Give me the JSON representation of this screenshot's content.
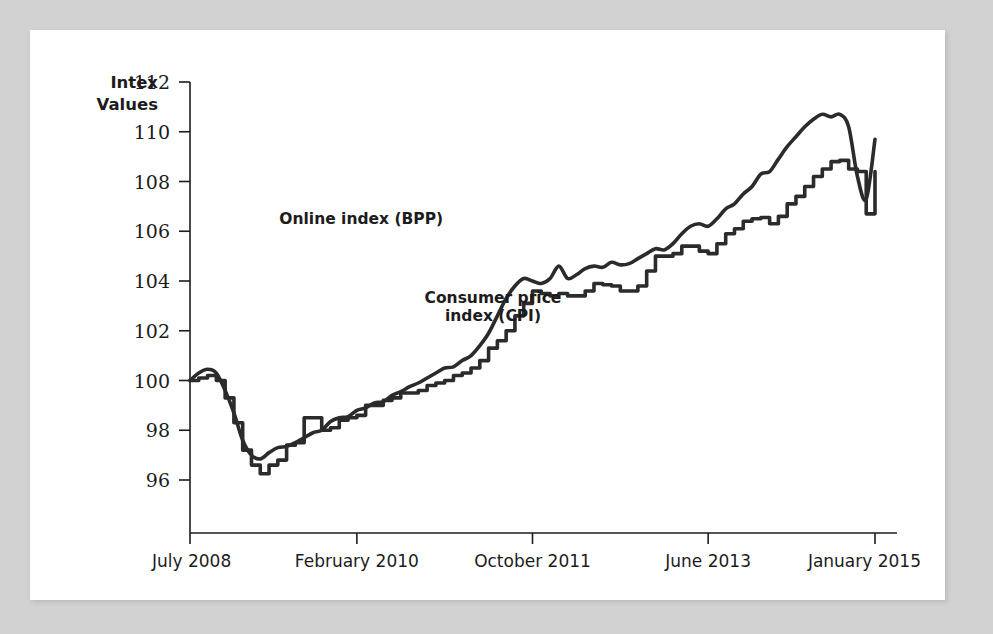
{
  "figure": {
    "background_color": "#d2d2d2",
    "card_color": "#ffffff",
    "line_color": "#2b2b2b"
  },
  "chart_data": {
    "type": "line",
    "title": "",
    "xlabel": "",
    "ylabel": "Intex\nValues",
    "ylabel_line1": "Intex",
    "ylabel_line2": "Values",
    "ylim": [
      95,
      112
    ],
    "ytick_values": [
      96,
      98,
      100,
      102,
      104,
      106,
      108,
      110,
      112
    ],
    "ytick_labels": [
      "96",
      "98",
      "100",
      "102",
      "104",
      "106",
      "108",
      "110",
      "112"
    ],
    "xlim": [
      0,
      78
    ],
    "xtick_positions": [
      0,
      19,
      39,
      59,
      78
    ],
    "xtick_labels": [
      "July 2008",
      "February 2010",
      "October 2011",
      "June 2013",
      "January 2015"
    ],
    "grid": false,
    "legend_position": "inline-annotation",
    "annotations": [
      {
        "text": "Online index (BPP)",
        "x": 19.5,
        "y": 106.3
      },
      {
        "text": "Consumer price",
        "x": 34.5,
        "y": 103.1
      },
      {
        "text": "index (CPI)",
        "x": 34.5,
        "y": 102.4
      }
    ],
    "series": [
      {
        "name": "Online index (BPP)",
        "style": "smooth",
        "x": [
          0,
          1,
          2,
          3,
          4,
          5,
          6,
          7,
          8,
          9,
          10,
          11,
          12,
          13,
          14,
          15,
          16,
          17,
          18,
          19,
          20,
          21,
          22,
          23,
          24,
          25,
          26,
          27,
          28,
          29,
          30,
          31,
          32,
          33,
          34,
          35,
          36,
          37,
          38,
          39,
          40,
          41,
          42,
          43,
          44,
          45,
          46,
          47,
          48,
          49,
          50,
          51,
          52,
          53,
          54,
          55,
          56,
          57,
          58,
          59,
          60,
          61,
          62,
          63,
          64,
          65,
          66,
          67,
          68,
          69,
          70,
          71,
          72,
          73,
          74,
          75,
          76,
          77,
          78
        ],
        "values": [
          100.0,
          100.3,
          100.45,
          100.3,
          99.6,
          98.7,
          97.6,
          97.0,
          96.85,
          97.1,
          97.3,
          97.35,
          97.5,
          97.7,
          97.9,
          98.0,
          98.35,
          98.5,
          98.55,
          98.8,
          98.9,
          99.1,
          99.15,
          99.4,
          99.55,
          99.75,
          99.9,
          100.1,
          100.3,
          100.5,
          100.55,
          100.8,
          101.0,
          101.4,
          101.9,
          102.6,
          103.3,
          103.8,
          104.1,
          104.0,
          103.9,
          104.1,
          104.6,
          104.1,
          104.25,
          104.5,
          104.6,
          104.55,
          104.75,
          104.65,
          104.7,
          104.9,
          105.1,
          105.3,
          105.25,
          105.5,
          105.9,
          106.2,
          106.3,
          106.2,
          106.5,
          106.9,
          107.1,
          107.5,
          107.8,
          108.3,
          108.4,
          108.9,
          109.4,
          109.8,
          110.2,
          110.5,
          110.7,
          110.6,
          110.7,
          110.2,
          108.2,
          107.3,
          109.7
        ]
      },
      {
        "name": "Consumer price index (CPI)",
        "style": "step",
        "x": [
          0,
          1,
          2,
          3,
          4,
          5,
          6,
          7,
          8,
          9,
          10,
          11,
          12,
          13,
          14,
          15,
          16,
          17,
          18,
          19,
          20,
          21,
          22,
          23,
          24,
          25,
          26,
          27,
          28,
          29,
          30,
          31,
          32,
          33,
          34,
          35,
          36,
          37,
          38,
          39,
          40,
          41,
          42,
          43,
          44,
          45,
          46,
          47,
          48,
          49,
          50,
          51,
          52,
          53,
          54,
          55,
          56,
          57,
          58,
          59,
          60,
          61,
          62,
          63,
          64,
          65,
          66,
          67,
          68,
          69,
          70,
          71,
          72,
          73,
          74,
          75,
          76,
          77,
          78
        ],
        "values": [
          100.0,
          100.1,
          100.2,
          100.0,
          99.3,
          98.3,
          97.2,
          96.6,
          96.25,
          96.6,
          96.8,
          97.4,
          97.5,
          98.5,
          98.5,
          98.0,
          98.1,
          98.4,
          98.5,
          98.6,
          99.0,
          99.0,
          99.2,
          99.3,
          99.5,
          99.5,
          99.6,
          99.8,
          99.9,
          100.0,
          100.2,
          100.3,
          100.5,
          100.8,
          101.3,
          101.6,
          102.0,
          102.6,
          103.1,
          103.6,
          103.5,
          103.4,
          103.5,
          103.4,
          103.4,
          103.6,
          103.9,
          103.85,
          103.8,
          103.6,
          103.6,
          103.8,
          104.4,
          105.0,
          105.0,
          105.1,
          105.4,
          105.4,
          105.2,
          105.1,
          105.5,
          105.9,
          106.1,
          106.4,
          106.5,
          106.55,
          106.3,
          106.6,
          107.1,
          107.4,
          107.8,
          108.2,
          108.5,
          108.8,
          108.85,
          108.5,
          108.4,
          106.7,
          108.4
        ]
      }
    ]
  }
}
